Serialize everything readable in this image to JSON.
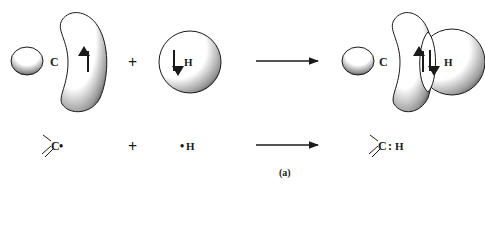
{
  "diagram": {
    "caption": "(a)",
    "top_row": {
      "reactant_carbon": {
        "atom_label": "C",
        "small_lobe": "sp3-minor-lobe",
        "large_lobe": "sp3-major-lobe",
        "spin": "up"
      },
      "plus": "+",
      "reactant_hydrogen": {
        "atom_label": "H",
        "orbital": "1s",
        "spin": "down"
      },
      "arrow": "reaction-arrow",
      "product": {
        "carbon_label": "C",
        "hydrogen_label": "H",
        "bond_spins": [
          "up",
          "down"
        ]
      }
    },
    "bottom_row": {
      "reactant_carbon": "C",
      "reactant_carbon_dot": "•",
      "plus": "+",
      "reactant_hydrogen_dot": "•",
      "reactant_hydrogen": "H",
      "arrow": "reaction-arrow",
      "product_carbon": "C",
      "product_bond": ":",
      "product_hydrogen": "H"
    },
    "colors": {
      "ink": "#1a1a1a",
      "background": "#ffffff"
    }
  }
}
